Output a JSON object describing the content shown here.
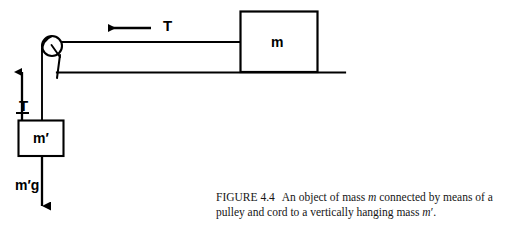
{
  "figure": {
    "number_label": "FIGURE 4.4",
    "caption_part_1": "An object of mass ",
    "caption_italic_1": "m",
    "caption_part_2": " connected by means of a pulley and cord to a vertically hanging mass ",
    "caption_italic_2": "m",
    "caption_prime_2": "′",
    "caption_part_3": ".",
    "caption_full": "FIGURE 4.4   An object of mass m connected by means of a pulley and cord to a vertically hanging mass m′."
  },
  "diagram": {
    "type": "free-body-pulley-diagram",
    "stroke_color": "#000000",
    "background_color": "#ffffff",
    "labels": {
      "tension_horizontal": "T",
      "tension_vertical": "T",
      "mass_block": "m",
      "hanging_mass": "m′",
      "hanging_weight": "m′g"
    },
    "elements": {
      "pulley": {
        "cx": 52,
        "cy": 46,
        "r": 10
      },
      "block_m": {
        "x": 240,
        "y": 11,
        "width": 78,
        "height": 61
      },
      "block_m_prime": {
        "x": 18,
        "y": 120,
        "width": 46,
        "height": 36
      },
      "table_line": {
        "x1": 58,
        "y1": 72,
        "x2": 345,
        "y2": 72
      },
      "cord_horizontal": {
        "x1": 52,
        "y1": 42,
        "x2": 240,
        "y2": 42
      },
      "cord_vertical": {
        "x1": 42,
        "y1": 50,
        "x2": 42,
        "y2": 120
      },
      "arrow_tension_horizontal": {
        "x1": 150,
        "y1": 28,
        "x2": 104,
        "y2": 28,
        "direction": "left"
      },
      "arrow_tension_vertical": {
        "x1": 22,
        "y1": 120,
        "x2": 22,
        "y2": 66,
        "direction": "up"
      },
      "arrow_weight": {
        "x1": 42,
        "y1": 156,
        "x2": 42,
        "y2": 213,
        "direction": "down"
      }
    }
  }
}
